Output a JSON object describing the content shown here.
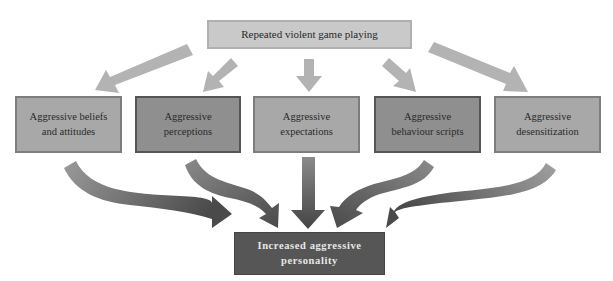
{
  "diagram": {
    "source": {
      "label": "Repeated violent game playing"
    },
    "mediators": [
      {
        "label": "Aggressive beliefs and attitudes",
        "line1": "Aggressive beliefs",
        "line2": "and attitudes",
        "shade": "light"
      },
      {
        "label": "Aggressive perceptions",
        "line1": "Aggressive",
        "line2": "perceptions",
        "shade": "dark"
      },
      {
        "label": "Aggressive expectations",
        "line1": "Aggressive",
        "line2": "expectations",
        "shade": "light"
      },
      {
        "label": "Aggressive behaviour scripts",
        "line1": "Aggressive",
        "line2": "behaviour scripts",
        "shade": "dark"
      },
      {
        "label": "Aggressive desensitization",
        "line1": "Aggressive",
        "line2": "desensitization",
        "shade": "light"
      }
    ],
    "outcome": {
      "label": "Increased aggressive personality",
      "line1": "Increased aggressive",
      "line2": "personality"
    },
    "edges": [
      {
        "from": "source",
        "to": "mediator-1"
      },
      {
        "from": "source",
        "to": "mediator-2"
      },
      {
        "from": "source",
        "to": "mediator-3"
      },
      {
        "from": "source",
        "to": "mediator-4"
      },
      {
        "from": "source",
        "to": "mediator-5"
      },
      {
        "from": "mediator-1",
        "to": "outcome"
      },
      {
        "from": "mediator-2",
        "to": "outcome"
      },
      {
        "from": "mediator-3",
        "to": "outcome"
      },
      {
        "from": "mediator-4",
        "to": "outcome"
      },
      {
        "from": "mediator-5",
        "to": "outcome"
      }
    ],
    "colors": {
      "source_fill": "#c9c9c9",
      "mediator_light_fill": "#a8a8a8",
      "mediator_dark_fill": "#8f8f8f",
      "outcome_fill": "#565656",
      "top_arrow": "#b3b3b3",
      "bottom_arrow_dark": "#505050"
    }
  }
}
